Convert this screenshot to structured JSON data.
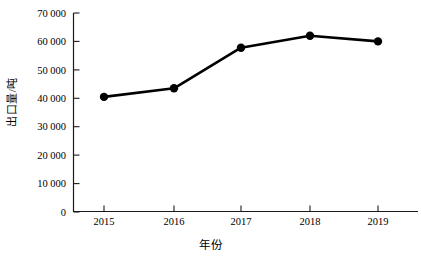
{
  "chart_data": {
    "type": "line",
    "title": "",
    "xlabel": "年份",
    "ylabel": "出口量/吨",
    "categories": [
      "2015",
      "2016",
      "2017",
      "2018",
      "2019"
    ],
    "values": [
      40500,
      43500,
      57800,
      62000,
      60000
    ],
    "series": [
      {
        "name": "出口量",
        "values": [
          40500,
          43500,
          57800,
          62000,
          60000
        ]
      }
    ],
    "ylim": [
      0,
      70000
    ],
    "ytick_values": [
      0,
      10000,
      20000,
      30000,
      40000,
      50000,
      60000,
      70000
    ],
    "ytick_labels": [
      "0",
      "10 000",
      "20 000",
      "30 000",
      "40 000",
      "50 000",
      "60 000",
      "70 000"
    ],
    "xtick_labels": [
      "2015",
      "2016",
      "2017",
      "2018",
      "2019"
    ],
    "grid": false,
    "legend": false,
    "legend_position": "none",
    "marker": "filled-circle",
    "line_color": "#000000",
    "marker_color": "#000000",
    "background_color": "#ffffff",
    "axis_color": "#000000",
    "tick_direction": "in"
  }
}
